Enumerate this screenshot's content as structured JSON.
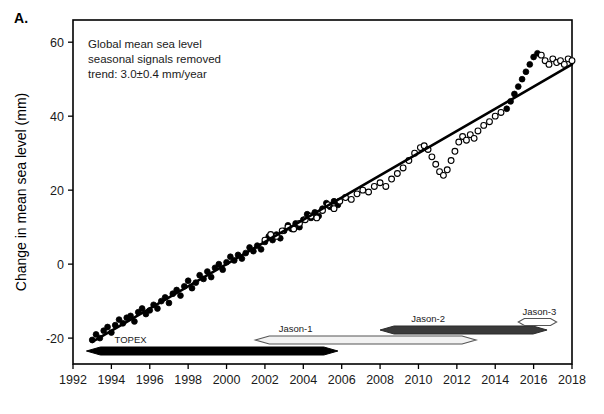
{
  "panel": {
    "label": "A."
  },
  "chart_data": {
    "type": "scatter",
    "title": "",
    "xlabel": "",
    "ylabel": "Change in mean sea level (mm)",
    "xlim": [
      1992,
      2018
    ],
    "ylim": [
      -27,
      66
    ],
    "xticks": [
      1992,
      1994,
      1996,
      1998,
      2000,
      2002,
      2004,
      2006,
      2008,
      2010,
      2012,
      2014,
      2016,
      2018
    ],
    "xtick_labels": [
      "1992",
      "1994",
      "1996",
      "1998",
      "2000",
      "2002",
      "2004",
      "2006",
      "2008",
      "2010",
      "2012",
      "2014",
      "2016",
      "2018"
    ],
    "yticks": [
      -20,
      0,
      20,
      40,
      60
    ],
    "ytick_labels": [
      "-20",
      "0",
      "20",
      "40",
      "60"
    ],
    "grid": false,
    "legend_position": "none",
    "annotations": [
      "Global mean sea level",
      "seasonal signals removed",
      "trend: 3.0±0.4 mm/year"
    ],
    "trend_line": {
      "label": "linear trend",
      "slope_mm_per_year": 3.0,
      "uncertainty_mm_per_year": 0.4,
      "x_start": 1993.0,
      "y_start": -21.0,
      "x_end": 2018.0,
      "y_end": 54.0
    },
    "series": [
      {
        "name": "Filled markers (TOPEX / Jason era sea level)",
        "marker": "filled-circle",
        "x": [
          1993.0,
          1993.2,
          1993.4,
          1993.6,
          1993.8,
          1994.0,
          1994.2,
          1994.4,
          1994.6,
          1994.8,
          1995.0,
          1995.2,
          1995.4,
          1995.6,
          1995.8,
          1996.0,
          1996.2,
          1996.4,
          1996.6,
          1996.8,
          1997.0,
          1997.2,
          1997.4,
          1997.6,
          1997.8,
          1998.0,
          1998.2,
          1998.4,
          1998.6,
          1998.8,
          1999.0,
          1999.2,
          1999.4,
          1999.6,
          1999.8,
          2000.0,
          2000.2,
          2000.4,
          2000.6,
          2000.8,
          2001.0,
          2001.2,
          2001.4,
          2001.6,
          2001.8,
          2002.0,
          2002.2,
          2002.4,
          2002.6,
          2002.8,
          2003.0,
          2003.2,
          2003.4,
          2003.6,
          2003.8,
          2004.0,
          2004.2,
          2004.4,
          2004.6,
          2004.8,
          2005.0,
          2005.2,
          2005.4,
          2005.6,
          2005.8,
          2014.6,
          2014.8,
          2015.0,
          2015.2,
          2015.4,
          2015.6,
          2015.8,
          2016.0,
          2016.2
        ],
        "y": [
          -20.5,
          -19.0,
          -20.0,
          -18.0,
          -17.0,
          -18.5,
          -16.5,
          -15.0,
          -16.0,
          -14.5,
          -14.0,
          -15.5,
          -13.0,
          -12.0,
          -13.5,
          -12.5,
          -11.0,
          -12.0,
          -10.0,
          -9.0,
          -10.5,
          -8.0,
          -7.0,
          -8.5,
          -6.0,
          -4.5,
          -6.5,
          -5.0,
          -3.0,
          -4.0,
          -2.0,
          -3.5,
          -1.0,
          0.0,
          -1.5,
          0.5,
          2.0,
          1.0,
          2.5,
          1.5,
          3.0,
          4.5,
          3.5,
          5.0,
          4.0,
          6.0,
          7.5,
          6.5,
          8.0,
          7.0,
          9.0,
          10.5,
          9.5,
          11.0,
          10.0,
          12.0,
          13.5,
          12.5,
          14.0,
          13.0,
          15.0,
          16.5,
          15.5,
          17.0,
          16.0,
          42.0,
          44.0,
          46.0,
          48.0,
          50.0,
          52.0,
          54.0,
          56.0,
          57.0
        ]
      },
      {
        "name": "Open markers (later Jason era sea level)",
        "marker": "open-circle",
        "x": [
          2002.0,
          2002.3,
          2002.6,
          2002.9,
          2003.2,
          2003.5,
          2003.8,
          2004.1,
          2004.4,
          2004.7,
          2005.0,
          2005.3,
          2005.6,
          2005.9,
          2006.2,
          2006.5,
          2006.8,
          2007.1,
          2007.4,
          2007.7,
          2008.0,
          2008.3,
          2008.6,
          2008.9,
          2009.2,
          2009.5,
          2009.8,
          2010.1,
          2010.3,
          2010.5,
          2010.7,
          2010.9,
          2011.1,
          2011.3,
          2011.5,
          2011.7,
          2011.9,
          2012.1,
          2012.3,
          2012.5,
          2012.7,
          2012.9,
          2013.1,
          2013.4,
          2013.7,
          2014.0,
          2014.3,
          2016.4,
          2016.6,
          2016.8,
          2017.0,
          2017.2,
          2017.4,
          2017.6,
          2017.8,
          2018.0
        ],
        "y": [
          6.5,
          8.0,
          7.5,
          9.0,
          10.0,
          9.5,
          11.0,
          12.0,
          13.0,
          12.5,
          14.5,
          16.0,
          15.0,
          17.0,
          18.0,
          17.5,
          19.0,
          20.0,
          19.5,
          21.0,
          22.0,
          21.0,
          23.0,
          24.5,
          26.0,
          28.0,
          30.0,
          31.5,
          32.0,
          31.0,
          29.0,
          27.0,
          25.0,
          24.0,
          25.5,
          28.0,
          30.5,
          33.0,
          34.5,
          33.5,
          35.0,
          34.0,
          36.0,
          37.5,
          38.5,
          40.0,
          41.0,
          56.5,
          55.0,
          54.0,
          55.5,
          54.5,
          55.0,
          54.0,
          55.5,
          55.0
        ]
      }
    ],
    "missions": [
      {
        "name": "TOPEX",
        "start": 1992.7,
        "end": 2005.8,
        "fill": "#000000",
        "style": "solid-black",
        "label_x": 1995.0,
        "label_side": "above"
      },
      {
        "name": "Jason-1",
        "start": 2001.5,
        "end": 2013.0,
        "fill": "#f2f2f2",
        "style": "hollow-light",
        "label_x": 2003.6,
        "label_side": "above"
      },
      {
        "name": "Jason-2",
        "start": 2008.0,
        "end": 2016.7,
        "fill": "#3a3a3a",
        "style": "dark-gray",
        "label_x": 2010.5,
        "label_side": "above"
      },
      {
        "name": "Jason-3",
        "start": 2015.2,
        "end": 2017.2,
        "fill": "#ffffff",
        "style": "hollow-white",
        "label_x": 2016.3,
        "label_side": "above"
      }
    ]
  }
}
